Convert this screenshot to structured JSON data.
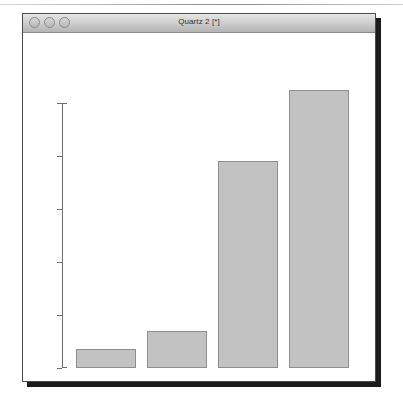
{
  "window": {
    "title": "Quartz 2 [*]",
    "controls": [
      {
        "name": "close-button",
        "label": "close"
      },
      {
        "name": "minimize-button",
        "label": "minimize"
      },
      {
        "name": "zoom-button",
        "label": "zoom"
      }
    ]
  },
  "colors": {
    "bar_fill": "#c2c2c2",
    "bar_border": "#8e8e8e",
    "axis": "#6e6e6e",
    "titlebar_top": "#e9e9e9",
    "titlebar_bottom": "#b4b4b4",
    "window_border": "#4a4a4a",
    "canvas": "#ffffff"
  },
  "chart_data": {
    "type": "bar",
    "title": "",
    "xlabel": "",
    "ylabel": "",
    "categories": [
      "1",
      "2",
      "3",
      "4"
    ],
    "values": [
      7,
      14,
      78,
      105
    ],
    "ylim": [
      0,
      110
    ],
    "yticks": [
      0,
      20,
      40,
      60,
      80,
      100
    ],
    "ytick_labels": [
      "0",
      "20",
      "40",
      "60",
      "80",
      "100"
    ],
    "grid": false,
    "legend": false,
    "xaxis_visible": false,
    "ytick_label_rotation": 90
  }
}
